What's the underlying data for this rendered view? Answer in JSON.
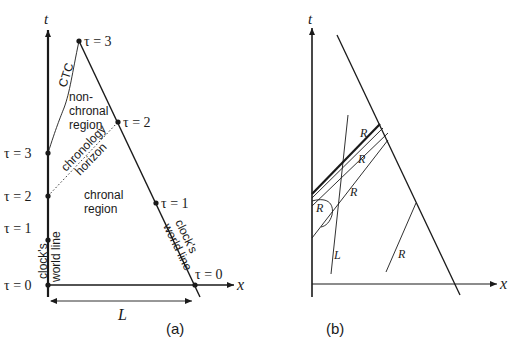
{
  "colors": {
    "ink": "#1a1a1a",
    "background": "#ffffff"
  },
  "panel_a": {
    "caption": "(a)",
    "t_axis_label": "t",
    "x_axis_label": "x",
    "length_label": "L",
    "left_ticks": [
      "τ = 0",
      "τ = 1",
      "τ = 2",
      "τ = 3"
    ],
    "right_ticks": [
      "τ = 0",
      "τ = 1",
      "τ = 2",
      "τ = 3"
    ],
    "ctc_label": "CTC",
    "nonchronal_label": [
      "non-",
      "chronal",
      "region"
    ],
    "horizon_label": [
      "chronology",
      "horizon"
    ],
    "chronal_label": [
      "chronal",
      "region"
    ],
    "left_worldline_label": [
      "clock's",
      "world line"
    ],
    "right_worldline_label": [
      "clock's",
      "world line"
    ]
  },
  "panel_b": {
    "caption": "(b)",
    "t_axis_label": "t",
    "x_axis_label": "x",
    "ray_labels": [
      "R",
      "R",
      "R",
      "R",
      "R"
    ],
    "line_label": "L"
  }
}
